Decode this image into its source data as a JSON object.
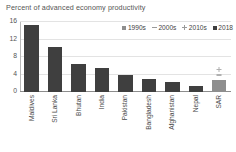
{
  "chart_data": {
    "type": "bar",
    "title": "Percent of advanced economy productivity",
    "xlabel": "",
    "ylabel": "",
    "ylim": [
      0,
      16
    ],
    "yticks": [
      0,
      4,
      8,
      12,
      16
    ],
    "grid": true,
    "legend_position": "top-right",
    "categories": [
      "Maldives",
      "Sri Lanka",
      "Bhutan",
      "India",
      "Pakistan",
      "Bangladesh",
      "Afghanistan",
      "Nepal",
      "SAR"
    ],
    "legend": [
      "1990s",
      "2000s",
      "2010s",
      "2018"
    ],
    "series": [
      {
        "name": "2018",
        "marker": "square",
        "values": [
          15.3,
          10.2,
          6.3,
          5.6,
          4.0,
          3.0,
          2.4,
          1.4,
          2.8
        ]
      },
      {
        "name": "2000s",
        "marker": "dash",
        "values": [
          null,
          null,
          null,
          null,
          null,
          null,
          null,
          null,
          4.0
        ]
      },
      {
        "name": "2010s",
        "marker": "plus",
        "values": [
          null,
          null,
          null,
          null,
          null,
          null,
          null,
          null,
          5.2
        ]
      }
    ],
    "colors": {
      "bar": "#3f3f3f",
      "bar_light": "#8e8e8e",
      "marker": "#b0b0b0",
      "grid": "#e3e3e3",
      "axis": "#8d8d8d",
      "text": "#4a4a4a"
    }
  }
}
